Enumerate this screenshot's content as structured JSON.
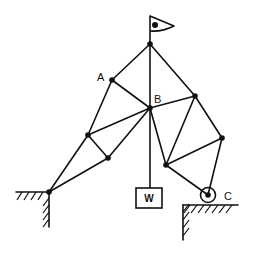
{
  "diagram": {
    "type": "truss",
    "labels": {
      "A": "A",
      "B": "B",
      "C": "C",
      "weight": "W"
    },
    "nodes": [
      {
        "id": "top",
        "x": 150,
        "y": 44
      },
      {
        "id": "A",
        "x": 112,
        "y": 80
      },
      {
        "id": "B",
        "x": 150,
        "y": 108
      },
      {
        "id": "R1",
        "x": 195,
        "y": 96
      },
      {
        "id": "L1",
        "x": 88,
        "y": 135
      },
      {
        "id": "R2",
        "x": 222,
        "y": 138
      },
      {
        "id": "L2",
        "x": 108,
        "y": 158
      },
      {
        "id": "M",
        "x": 166,
        "y": 165
      },
      {
        "id": "S",
        "x": 49,
        "y": 192
      },
      {
        "id": "C",
        "x": 208,
        "y": 195
      }
    ],
    "members": [
      [
        "top",
        "A"
      ],
      [
        "top",
        "B"
      ],
      [
        "top",
        "R1"
      ],
      [
        "A",
        "B"
      ],
      [
        "A",
        "L1"
      ],
      [
        "B",
        "R1"
      ],
      [
        "B",
        "L1"
      ],
      [
        "B",
        "L2"
      ],
      [
        "B",
        "M"
      ],
      [
        "L1",
        "L2"
      ],
      [
        "L1",
        "S"
      ],
      [
        "L2",
        "S"
      ],
      [
        "R1",
        "M"
      ],
      [
        "R1",
        "R2"
      ],
      [
        "M",
        "R2"
      ],
      [
        "M",
        "C"
      ],
      [
        "R2",
        "C"
      ]
    ],
    "supports": {
      "left": "fixed pin at ground corner",
      "right": "roller at C"
    },
    "load": "weight W hanging from B",
    "flag": "flag on top of mast"
  }
}
